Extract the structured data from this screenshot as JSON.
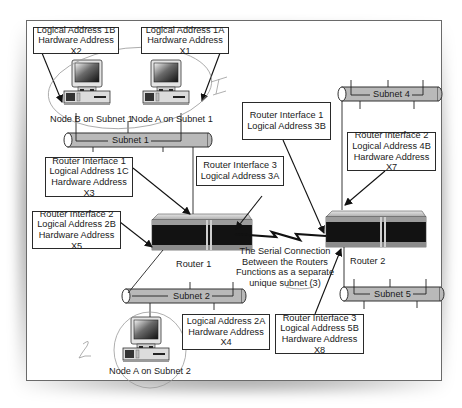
{
  "diagram": {
    "callouts": {
      "node_b_subnet1": [
        "Logical Address 1B",
        "Hardware Address X2"
      ],
      "node_a_subnet1": [
        "Logical Address 1A",
        "Hardware Address X1"
      ],
      "router1_if1": [
        "Router Interface 1",
        "Logical Address 1C",
        "Hardware Address X3"
      ],
      "router1_if3": [
        "Router Interface 3",
        "Logical Address 3A"
      ],
      "router1_if2": [
        "Router Interface 2",
        "Logical Address 2B",
        "Hardware Address X5"
      ],
      "router2_if1": [
        "Router Interface 1",
        "Logical Address 3B"
      ],
      "router2_if2": [
        "Router Interface 2",
        "Logical Address 4B",
        "Hardware Address X7"
      ],
      "node_a_subnet2": [
        "Logical Address 2A",
        "Hardware Address X4"
      ],
      "router2_if3": [
        "Router Interface 3",
        "Logical Address 5B",
        "Hardware Address X8"
      ]
    },
    "node_labels": {
      "node_b_subnet1": "Node B on Subnet 1",
      "node_a_subnet1": "Node A on Subnet 1",
      "node_a_subnet2": "Node A on Subnet 2"
    },
    "subnets": {
      "subnet1": "Subnet 1",
      "subnet2": "Subnet 2",
      "subnet4": "Subnet 4",
      "subnet5": "Subnet 5"
    },
    "routers": {
      "router1": "Router 1",
      "router2": "Router 2"
    },
    "serial_note": [
      "The Serial Connection",
      "Between the Routers",
      "Functions as a separate",
      "unique subnet (3)"
    ],
    "handwritten_marks": [
      "1",
      "2"
    ]
  },
  "colors": {
    "cable_fill": "#b9b9b9",
    "outline": "#2a2a2a",
    "router_face": "#111111",
    "router_top": "#d8d8d8",
    "annotation_pencil": "#9a9a9a"
  }
}
